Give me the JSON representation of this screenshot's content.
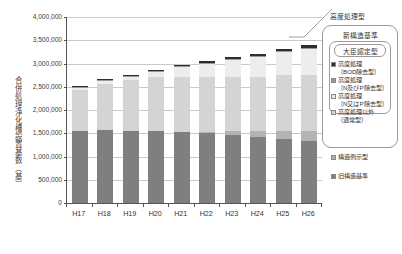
{
  "chart_data": {
    "type": "bar",
    "stacked": true,
    "title": "",
    "xlabel": "",
    "ylabel": "合併処理浄化槽設置基数（基）",
    "categories": [
      "H17",
      "H18",
      "H19",
      "H20",
      "H21",
      "H22",
      "H23",
      "H24",
      "H25",
      "H26"
    ],
    "ylim": [
      0,
      4000000
    ],
    "ytick_step": 500000,
    "ytick_labels": [
      "0",
      "500,000",
      "1,000,000",
      "1,500,000",
      "2,000,000",
      "2,500,000",
      "3,000,000",
      "3,500,000",
      "4,000,000"
    ],
    "grid": true,
    "legend_position": "right",
    "series": [
      {
        "name": "旧構造基準",
        "key": "old",
        "color": "#7f7f7f",
        "values": [
          1550000,
          1560000,
          1555000,
          1545000,
          1530000,
          1500000,
          1460000,
          1420000,
          1370000,
          1330000
        ]
      },
      {
        "name": "構造例示型",
        "key": "struct",
        "color": "#b3b3b3",
        "values": [
          0,
          0,
          0,
          0,
          0,
          35000,
          80000,
          120000,
          175000,
          215000
        ]
      },
      {
        "name": "高度処理以外（通常型）",
        "key": "normal",
        "color": "#d4d4d4",
        "values": [
          880000,
          990000,
          1080000,
          1170000,
          1180000,
          1180000,
          1180000,
          1180000,
          1200000,
          1210000
        ]
      },
      {
        "name": "高度処理（N又はP除去型）",
        "key": "adv_nop",
        "color": "#ededed",
        "values": [
          60000,
          75000,
          85000,
          100000,
          215000,
          285000,
          355000,
          425000,
          500000,
          560000
        ]
      },
      {
        "name": "高度処理（N及びP除去型）",
        "key": "adv_np",
        "color": "#9a9a9a",
        "values": [
          10000,
          12000,
          14000,
          16000,
          18000,
          20000,
          22000,
          24000,
          26000,
          28000
        ]
      },
      {
        "name": "高度処理（BOD除去型）",
        "key": "adv_bod",
        "color": "#2e2e2e",
        "values": [
          20000,
          23000,
          26000,
          29000,
          32000,
          35000,
          38000,
          41000,
          44000,
          47000
        ]
      },
      {
        "name": "大臣認定型",
        "key": "minister",
        "color": "#f4f4f4",
        "values": [
          0,
          0,
          0,
          0,
          0,
          0,
          0,
          0,
          0,
          0
        ]
      }
    ],
    "totals": [
      2520000,
      2660000,
      2760000,
      2860000,
      2975000,
      3055000,
      3135000,
      3210000,
      3315000,
      3390000
    ]
  },
  "legend": {
    "title_advanced": "高度処理型",
    "title_new_standard": "新構造基準",
    "title_minister": "大臣認定型",
    "entries": [
      {
        "label": "高度処理",
        "sub": "（BOD除去型）",
        "swatch": "#2e2e2e"
      },
      {
        "label": "高度処理",
        "sub": "（N及びP除去型）",
        "swatch": "#9a9a9a"
      },
      {
        "label": "高度処理",
        "sub": "（N又はP除去型）",
        "swatch": "#ededed"
      },
      {
        "label": "高度処理以外",
        "sub": "（通常型）",
        "swatch": "#d4d4d4"
      }
    ],
    "entry_struct": {
      "label": "構造例示型",
      "swatch": "#b3b3b3"
    },
    "entry_old": {
      "label": "旧構造基準",
      "swatch": "#7f7f7f"
    }
  },
  "footnotes": {
    "left": "",
    "right": ""
  },
  "colors": {
    "axis": "#555555",
    "grid": "#c9c9c9",
    "text": "#333333",
    "background": "#ffffff"
  }
}
